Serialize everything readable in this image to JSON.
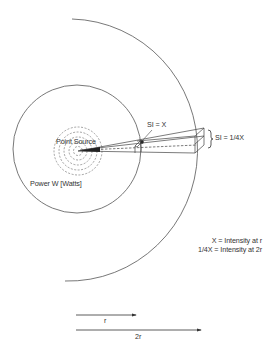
{
  "diagram": {
    "colors": {
      "line": "#555555",
      "text": "#333333",
      "background": "#ffffff"
    },
    "labels": {
      "point_source": "Point Source",
      "power": "Power W [Watts]",
      "si_near": "SI = X",
      "si_far": "SI = 1/4X",
      "brace": "}"
    },
    "legend": {
      "line1": "X = Intensity at r",
      "line2": "1/4X = Intensity at 2r"
    },
    "arrows": {
      "r_label": "r",
      "two_r_label": "2r"
    },
    "geometry": {
      "source_center": [
        77,
        150
      ],
      "inner_radius": 64,
      "outer_radius": 128,
      "dashed_rings": 5
    }
  }
}
